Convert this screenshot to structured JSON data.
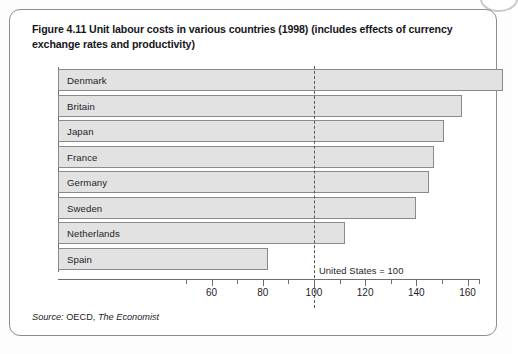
{
  "figure": {
    "title": "Figure 4.11  Unit labour costs in various countries (1998) (includes effects of currency exchange rates and productivity)",
    "source_prefix": "Source:",
    "source_body": " OECD, ",
    "source_publication": "The Economist"
  },
  "annotation": {
    "reference_note": "United States = 100"
  },
  "colors": {
    "bar_fill": "#e2e2e2",
    "bar_stroke": "#8a8a8a",
    "axis": "#6e6e6e",
    "reference_line": "#5a5a5a",
    "card_border": "#8d8d8d",
    "text": "#1d1d1f"
  },
  "chart_data": {
    "type": "bar",
    "orientation": "horizontal",
    "title": "Figure 4.11  Unit labour costs in various countries (1998) (includes effects of currency exchange rates and productivity)",
    "xlabel": "",
    "ylabel": "",
    "categories": [
      "Denmark",
      "Britain",
      "Japan",
      "France",
      "Germany",
      "Sweden",
      "Netherlands",
      "Spain"
    ],
    "values": [
      174,
      158,
      151,
      147,
      145,
      140,
      112,
      82
    ],
    "xlim": [
      0,
      168
    ],
    "axis_start_value": 0,
    "tick_labels": [
      "60",
      "80",
      "100",
      "120",
      "140",
      "160"
    ],
    "tick_values": [
      60,
      80,
      100,
      120,
      140,
      160
    ],
    "minor_tick_values": [
      50,
      70,
      90,
      110,
      130,
      150
    ],
    "minor_tick_interval": 10,
    "reference_line": {
      "value": 100,
      "label": "United States = 100",
      "style": "dashed"
    },
    "grid": false,
    "legend": null,
    "series": [
      {
        "name": "Unit labour costs (US = 100)",
        "values": [
          174,
          158,
          151,
          147,
          145,
          140,
          112,
          82
        ]
      }
    ],
    "source": "Source: OECD, The Economist"
  }
}
